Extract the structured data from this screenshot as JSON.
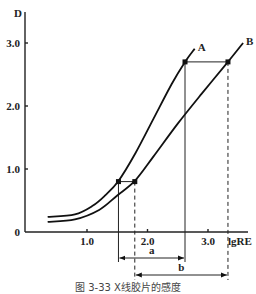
{
  "chart_data": {
    "type": "line",
    "title": "",
    "caption": "图 3-33  X线胶片的感度",
    "xlabel": "lgRE",
    "ylabel": "D",
    "xlim": [
      0,
      3.5
    ],
    "ylim": [
      0,
      3.2
    ],
    "x_ticks": [
      {
        "value": 1.0,
        "label": "1.0"
      },
      {
        "value": 2.0,
        "label": "2.0"
      },
      {
        "value": 3.0,
        "label": "3.0"
      }
    ],
    "y_ticks": [
      {
        "value": 0,
        "label": "0"
      },
      {
        "value": 1.0,
        "label": "1.0"
      },
      {
        "value": 2.0,
        "label": "2.0"
      },
      {
        "value": 3.0,
        "label": "3.0"
      }
    ],
    "grid": false,
    "series": [
      {
        "name": "A",
        "points": [
          [
            0.35,
            0.24
          ],
          [
            0.8,
            0.28
          ],
          [
            1.1,
            0.42
          ],
          [
            1.3,
            0.58
          ],
          [
            1.52,
            0.81
          ],
          [
            1.8,
            1.25
          ],
          [
            2.1,
            1.8
          ],
          [
            2.4,
            2.35
          ],
          [
            2.62,
            2.7
          ],
          [
            2.78,
            2.91
          ]
        ]
      },
      {
        "name": "B",
        "points": [
          [
            0.35,
            0.16
          ],
          [
            0.8,
            0.2
          ],
          [
            1.2,
            0.35
          ],
          [
            1.5,
            0.58
          ],
          [
            1.79,
            0.81
          ],
          [
            2.1,
            1.2
          ],
          [
            2.5,
            1.72
          ],
          [
            2.9,
            2.2
          ],
          [
            3.33,
            2.7
          ],
          [
            3.58,
            3.0
          ]
        ]
      }
    ],
    "marked_points": [
      {
        "series": "A",
        "x": 1.52,
        "y": 0.8
      },
      {
        "series": "B",
        "x": 1.79,
        "y": 0.8
      },
      {
        "series": "A",
        "x": 2.62,
        "y": 2.7
      },
      {
        "series": "B",
        "x": 3.33,
        "y": 2.7
      }
    ],
    "dimensions": [
      {
        "label": "a",
        "from": 1.52,
        "to": 2.62
      },
      {
        "label": "b",
        "from": 1.79,
        "to": 3.33
      }
    ]
  }
}
